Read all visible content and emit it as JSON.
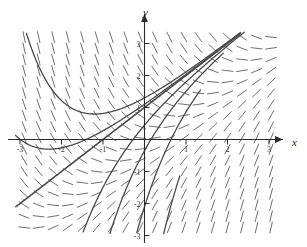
{
  "figure": {
    "title": "",
    "background_color": "#ffffff",
    "width": 307,
    "height": 247
  },
  "axes": {
    "x_axis_label": "x",
    "y_axis_label": "y",
    "axis_color": "#2b2b2b",
    "arrow_x_name": "x-axis-arrow",
    "arrow_y_name": "y-axis-arrow",
    "x_ticks": [
      {
        "value": -3,
        "label": "-3"
      },
      {
        "value": -2,
        "label": "-2"
      },
      {
        "value": -1,
        "label": "-1"
      },
      {
        "value": 1,
        "label": "1"
      },
      {
        "value": 2,
        "label": "2"
      },
      {
        "value": 3,
        "label": "3"
      }
    ],
    "y_ticks": [
      {
        "value": 3,
        "label": "3"
      },
      {
        "value": 2,
        "label": "2"
      },
      {
        "value": 1,
        "label": "1"
      },
      {
        "value": -1,
        "label": "-1"
      },
      {
        "value": -2,
        "label": "-2"
      },
      {
        "value": -3,
        "label": "-3"
      }
    ]
  },
  "chart_data": {
    "type": "line",
    "subtype": "direction-field-with-solution-curves",
    "title": "",
    "xlabel": "x",
    "ylabel": "y",
    "xlim": [
      -3.5,
      3.5
    ],
    "ylim": [
      -3.4,
      3.4
    ],
    "grid": false,
    "legend": null,
    "slope_field": {
      "equation": "dy/dx = x - y",
      "segment_color": "#555555",
      "segment_length_px": 11,
      "x_samples": [
        -3.25,
        -2.9,
        -2.55,
        -2.2,
        -1.85,
        -1.5,
        -1.15,
        -0.8,
        -0.45,
        -0.1,
        0.25,
        0.6,
        0.95,
        1.3,
        1.65,
        2.0,
        2.35,
        2.7,
        3.05,
        3.3
      ],
      "y_samples": [
        3.2,
        2.85,
        2.5,
        2.15,
        1.8,
        1.45,
        1.1,
        0.75,
        0.4,
        0.05,
        -0.3,
        -0.65,
        -1.0,
        -1.35,
        -1.7,
        -2.05,
        -2.4,
        -2.75,
        -3.1,
        -3.3
      ],
      "description": "Short tick marks whose slope equals x - y at each sample point; steep upward in upper-left, flattening to horizontal along the line y = x, steep downward in lower-right."
    },
    "solution_curves": [
      {
        "name": "separatrix",
        "kind": "line",
        "equation": "y = x + 1",
        "color": "#4a4a4a",
        "width_px": 1.6,
        "x_from": -3.5,
        "x_to": 2.3,
        "note": "Straight asymptotic solution through (-1, 0) with slope 1"
      },
      {
        "name": "curve-above-separatrix-1",
        "kind": "exponential",
        "equation": "y = x + 1 + 0.30*exp(-x)",
        "color": "#4a4a4a",
        "width_px": 1.3,
        "x_from": -3.1,
        "x_to": 2.4
      },
      {
        "name": "curve-below-separatrix-1",
        "kind": "exponential",
        "equation": "y = x + 1 - 0.55*exp(-x)",
        "color": "#4a4a4a",
        "width_px": 1.3,
        "x_from": -3.1,
        "x_to": 2.6
      },
      {
        "name": "curve-below-separatrix-2",
        "kind": "exponential",
        "equation": "y = x + 1 - 1.35*exp(-x)",
        "color": "#4a4a4a",
        "width_px": 1.3,
        "x_from": -2.9,
        "x_to": 1.9
      },
      {
        "name": "curve-below-separatrix-3",
        "kind": "exponential",
        "equation": "y = x + 1 - 3.1*exp(-x)",
        "color": "#4a4a4a",
        "width_px": 1.3,
        "x_from": -2.6,
        "x_to": 1.35
      },
      {
        "name": "curve-below-separatrix-4",
        "kind": "exponential",
        "equation": "y = x + 1 - 7.0*exp(-x)",
        "color": "#4a4a4a",
        "width_px": 1.3,
        "x_from": -2.2,
        "x_to": 0.85
      },
      {
        "name": "curve-above-separatrix-2",
        "kind": "exponential",
        "equation": "y = x + 1 + 0.10*exp(-x)",
        "color": "#4a4a4a",
        "width_px": 1.3,
        "x_from": -3.3,
        "x_to": 2.3
      }
    ],
    "convergence_point": {
      "x": -2.6,
      "y": -2.1,
      "note": "Curve bundle funnels together toward lower-left"
    }
  }
}
